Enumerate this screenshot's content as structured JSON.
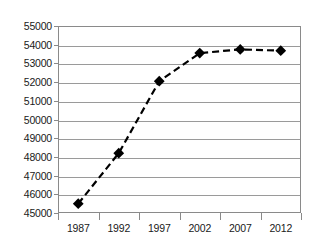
{
  "chart_data": {
    "type": "line",
    "title": "",
    "subtitle": "",
    "xlabel": "",
    "ylabel": "",
    "categories": [
      "1987",
      "1992",
      "1997",
      "2002",
      "2007",
      "2012"
    ],
    "values": [
      45500,
      48200,
      52050,
      53550,
      53750,
      53680
    ],
    "series": [
      {
        "name": "",
        "values": [
          45500,
          48200,
          52050,
          53550,
          53750,
          53680
        ]
      }
    ],
    "ylim": [
      45000,
      55000
    ],
    "yticks": [
      45000,
      46000,
      47000,
      48000,
      49000,
      50000,
      51000,
      52000,
      53000,
      54000,
      55000
    ],
    "ytick_labels": [
      "45000",
      "46000",
      "47000",
      "48000",
      "49000",
      "50000",
      "51000",
      "52000",
      "53000",
      "54000",
      "55000"
    ],
    "xtick_labels": [
      "1987",
      "1992",
      "1997",
      "2002",
      "2007",
      "2012"
    ],
    "grid": true,
    "grid_axis": "y",
    "legend": false,
    "legend_position": "none",
    "line_style": "dashed",
    "marker": "diamond",
    "colors": {
      "line": "#000000",
      "marker": "#000000",
      "gridline": "#9a9a9a",
      "axis": "#8a8a8a",
      "text": "#1a1a1a",
      "background": "#ffffff"
    }
  }
}
